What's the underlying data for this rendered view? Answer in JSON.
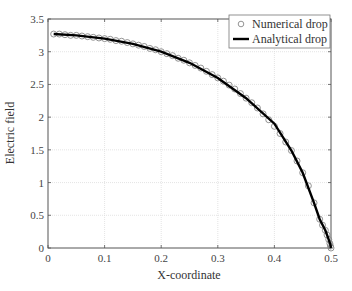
{
  "chart_data": {
    "type": "line",
    "title": "",
    "xlabel": "X-coordinate",
    "ylabel": "Electric field",
    "xlim": [
      0,
      0.5
    ],
    "ylim": [
      0,
      3.5
    ],
    "xticks": [
      0,
      0.1,
      0.2,
      0.3,
      0.4,
      0.5
    ],
    "xtick_labels": [
      "0",
      "0.1",
      "0.2",
      "0.3",
      "0.4",
      "0.5"
    ],
    "yticks": [
      0,
      0.5,
      1,
      1.5,
      2,
      2.5,
      3,
      3.5
    ],
    "ytick_labels": [
      "0",
      "0.5",
      "1",
      "1.5",
      "2",
      "2.5",
      "3",
      "3.5"
    ],
    "grid": true,
    "legend_position": "upper right",
    "series": [
      {
        "name": "Numerical drop",
        "style": "markers",
        "marker": "open-circle",
        "color": "#888888",
        "x": [
          0.01,
          0.02,
          0.03,
          0.04,
          0.05,
          0.06,
          0.07,
          0.08,
          0.09,
          0.1,
          0.11,
          0.12,
          0.13,
          0.14,
          0.15,
          0.16,
          0.17,
          0.18,
          0.19,
          0.2,
          0.21,
          0.22,
          0.23,
          0.24,
          0.25,
          0.26,
          0.27,
          0.28,
          0.29,
          0.3,
          0.31,
          0.32,
          0.33,
          0.34,
          0.35,
          0.36,
          0.37,
          0.38,
          0.39,
          0.4,
          0.41,
          0.42,
          0.43,
          0.44,
          0.45,
          0.46,
          0.47,
          0.48,
          0.485,
          0.49,
          0.493,
          0.496,
          0.498,
          0.499,
          0.5
        ],
        "y": [
          3.27,
          3.27,
          3.26,
          3.25,
          3.25,
          3.24,
          3.23,
          3.22,
          3.21,
          3.2,
          3.19,
          3.17,
          3.16,
          3.14,
          3.12,
          3.1,
          3.08,
          3.05,
          3.03,
          3.0,
          2.97,
          2.94,
          2.9,
          2.87,
          2.83,
          2.79,
          2.75,
          2.7,
          2.65,
          2.6,
          2.55,
          2.49,
          2.43,
          2.36,
          2.29,
          2.22,
          2.14,
          2.05,
          1.96,
          1.86,
          1.75,
          1.62,
          1.49,
          1.33,
          1.15,
          0.95,
          0.69,
          0.44,
          0.35,
          0.27,
          0.2,
          0.13,
          0.07,
          0.03,
          0.0
        ]
      },
      {
        "name": "Analytical drop",
        "style": "solid-line",
        "color": "#000000",
        "x": [
          0.01,
          0.05,
          0.1,
          0.15,
          0.2,
          0.25,
          0.3,
          0.35,
          0.4,
          0.43,
          0.45,
          0.47,
          0.48,
          0.49,
          0.495,
          0.499,
          0.5
        ],
        "y": [
          3.27,
          3.25,
          3.2,
          3.12,
          3.0,
          2.83,
          2.6,
          2.29,
          1.9,
          1.49,
          1.15,
          0.69,
          0.44,
          0.27,
          0.15,
          0.05,
          0.0
        ]
      }
    ]
  },
  "legend": {
    "items": [
      {
        "label": "Numerical drop",
        "marker": "open-circle"
      },
      {
        "label": "Analytical drop",
        "marker": "line"
      }
    ]
  },
  "colors": {
    "axis": "#555555",
    "grid": "#dddddd",
    "marker": "#888888",
    "line": "#000000"
  }
}
